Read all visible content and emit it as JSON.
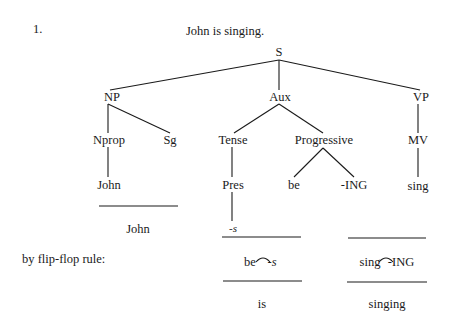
{
  "example_number": "1.",
  "sentence": "John is singing.",
  "tree": {
    "root": "S",
    "np": {
      "label": "NP",
      "nprop": "Nprop",
      "sg": "Sg",
      "john": "John"
    },
    "aux": {
      "label": "Aux",
      "tense": "Tense",
      "pres": "Pres",
      "suffix_s": "-s",
      "progressive": "Progressive",
      "be": "be",
      "ing": "-ING"
    },
    "vp": {
      "label": "VP",
      "mv": "MV",
      "sing": "sing"
    }
  },
  "derivation": {
    "john_output": "John",
    "rule_label": "by flip-flop rule:",
    "be_s_stem": "be",
    "be_s_suffix": "-s",
    "sing_ing_stem": "sing",
    "sing_ing_suffix": "-ING",
    "is_output": "is",
    "singing_output": "singing"
  }
}
